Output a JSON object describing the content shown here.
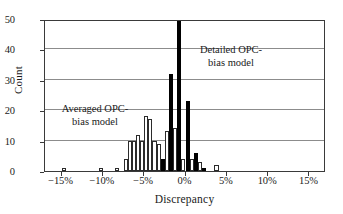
{
  "chart_data": {
    "type": "bar",
    "title": "",
    "subtitle": "",
    "xlabel": "Discrepancy",
    "ylabel": "Count",
    "xlim": [
      -17.0,
      17.0
    ],
    "ylim": [
      0,
      50
    ],
    "xticks": [
      -15,
      -10,
      -5,
      0,
      5,
      10,
      15
    ],
    "xtick_labels": [
      "−15%",
      "−10%",
      "−5%",
      "0%",
      "5%",
      "10%",
      "15%"
    ],
    "yticks": [
      0,
      10,
      20,
      30,
      40,
      50
    ],
    "ytick_labels": [
      "0",
      "10",
      "20",
      "30",
      "40",
      "50"
    ],
    "grid": "horizontal",
    "legend_position": "inline-annotations",
    "bin_width": 0.5,
    "series": [
      {
        "name": "Averaged OPC-bias model",
        "style": "open",
        "fill_color": "#ffffff",
        "edge_color": "#2b2b2b",
        "bins": [
          {
            "x": -14.75,
            "value": 1
          },
          {
            "x": -10.25,
            "value": 1
          },
          {
            "x": -8.25,
            "value": 1
          },
          {
            "x": -7.25,
            "value": 4
          },
          {
            "x": -6.75,
            "value": 10
          },
          {
            "x": -6.25,
            "value": 10
          },
          {
            "x": -5.75,
            "value": 12
          },
          {
            "x": -5.25,
            "value": 10
          },
          {
            "x": -4.75,
            "value": 18
          },
          {
            "x": -4.25,
            "value": 17
          },
          {
            "x": -3.75,
            "value": 10
          },
          {
            "x": -3.25,
            "value": 9
          },
          {
            "x": -2.25,
            "value": 13
          },
          {
            "x": -1.25,
            "value": 14
          },
          {
            "x": -0.25,
            "value": 4
          },
          {
            "x": 0.75,
            "value": 4
          },
          {
            "x": 1.75,
            "value": 3
          },
          {
            "x": 3.75,
            "value": 2
          }
        ]
      },
      {
        "name": "Detailed OPC-bias model",
        "style": "solid",
        "fill_color": "#000000",
        "edge_color": "#000000",
        "bins": [
          {
            "x": -2.75,
            "value": 4
          },
          {
            "x": -1.75,
            "value": 32
          },
          {
            "x": -0.75,
            "value": 50
          },
          {
            "x": 0.25,
            "value": 23
          },
          {
            "x": 1.25,
            "value": 6
          },
          {
            "x": 2.25,
            "value": 1
          }
        ]
      }
    ],
    "annotations": [
      {
        "id": "averaged",
        "text": "Averaged OPC-\nbias model",
        "x": -9.0,
        "y": 16.5
      },
      {
        "id": "detailed",
        "text": "Detailed OPC-\nbias model",
        "x": 4.5,
        "y": 37.5
      }
    ]
  },
  "colors": {
    "frame": "#3a3a3a",
    "grid": "#8c8c8c",
    "open_bar_fill": "#ffffff",
    "open_bar_edge": "#2b2b2b",
    "solid_bar": "#000000",
    "text": "#1a1a1a",
    "background": "#ffffff"
  }
}
